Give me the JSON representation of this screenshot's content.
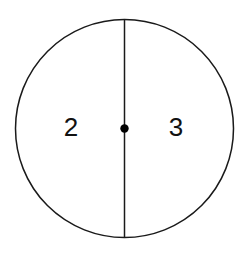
{
  "figure": {
    "canvas": {
      "width": 246,
      "height": 255,
      "background": "#ffffff"
    },
    "stroke_color": "#1a1a1a",
    "stroke_width": 1.5,
    "fill_color": "#ffffff",
    "circle": {
      "name": "circle-outline",
      "cx": 124.5,
      "cy": 128.5,
      "r": 109
    },
    "diameter_line": {
      "name": "vertical-diameter",
      "x1": 124.5,
      "y1": 19.5,
      "x2": 124.5,
      "y2": 237.5
    },
    "center_point": {
      "name": "center-dot",
      "cx": 124.5,
      "cy": 128.5,
      "r": 4.2,
      "color": "#000000"
    },
    "labels": [
      {
        "text": "2",
        "x": 71,
        "y": 129,
        "region": "left-half"
      },
      {
        "text": "3",
        "x": 176,
        "y": 129,
        "region": "right-half"
      }
    ]
  },
  "chart_data": {
    "type": "pie",
    "title": "",
    "categories": [
      "2",
      "3"
    ],
    "values": [
      1,
      1
    ],
    "labels": [
      "2",
      "3"
    ],
    "slice_angles_deg": [
      180,
      180
    ],
    "legend": "none",
    "grid": false
  }
}
